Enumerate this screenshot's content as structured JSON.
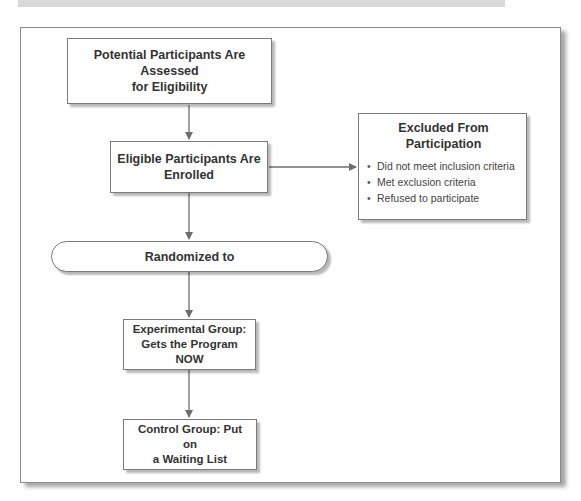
{
  "diagram": {
    "type": "flowchart",
    "nodes": {
      "assessed": {
        "label": "Potential Participants Are Assessed for Eligibility",
        "line1": "Potential Participants Are Assessed",
        "line2": "for Eligibility"
      },
      "enrolled": {
        "label": "Eligible Participants Are Enrolled",
        "line1": "Eligible Participants Are",
        "line2": "Enrolled"
      },
      "excluded": {
        "title_line1": "Excluded From",
        "title_line2": "Participation",
        "items": [
          "Did not meet inclusion criteria",
          "Met exclusion criteria",
          "Refused to participate"
        ]
      },
      "randomized": {
        "label": "Randomized to"
      },
      "experimental": {
        "line1": "Experimental Group:",
        "line2": "Gets the Program NOW"
      },
      "control": {
        "line1": "Control Group: Put on",
        "line2": "a Waiting List"
      }
    },
    "edges": [
      {
        "from": "assessed",
        "to": "enrolled"
      },
      {
        "from": "enrolled",
        "to": "excluded"
      },
      {
        "from": "enrolled",
        "to": "randomized"
      },
      {
        "from": "randomized",
        "to": "experimental"
      },
      {
        "from": "experimental",
        "to": "control"
      }
    ],
    "colors": {
      "border": "#7a7a7a",
      "arrow": "#6e6e6e",
      "topbar": "#d9d9d9",
      "text": "#333333"
    }
  }
}
